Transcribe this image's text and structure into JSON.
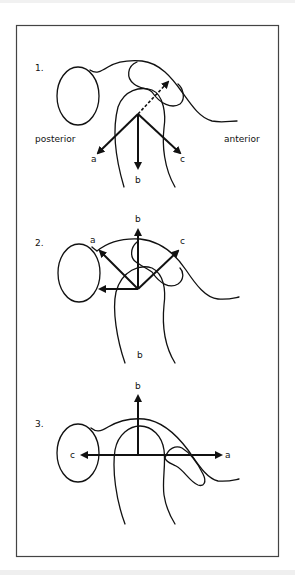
{
  "figure": {
    "frame_color": "#444444",
    "ink_color": "#111111",
    "panels": [
      {
        "number": "1.",
        "direction_labels": {
          "left": "posterior",
          "right": "anterior"
        },
        "arrows": [
          {
            "label": "a",
            "direction": "down-left"
          },
          {
            "label": "b",
            "direction": "down"
          },
          {
            "label": "c",
            "direction": "down-right"
          },
          {
            "label": "",
            "direction": "up-right (dashed)"
          }
        ]
      },
      {
        "number": "2.",
        "bottom_label": "b",
        "arrows": [
          {
            "label": "a",
            "direction": "up-left"
          },
          {
            "label": "b",
            "direction": "up"
          },
          {
            "label": "c",
            "direction": "up-right"
          },
          {
            "label": "",
            "direction": "left"
          }
        ]
      },
      {
        "number": "3.",
        "arrows": [
          {
            "label": "b",
            "direction": "up"
          },
          {
            "label": "c",
            "direction": "left"
          },
          {
            "label": "a",
            "direction": "right"
          }
        ]
      }
    ]
  }
}
